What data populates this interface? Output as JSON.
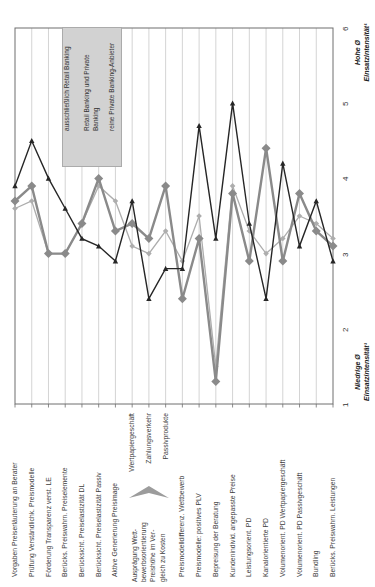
{
  "chart_data": {
    "type": "line",
    "orientation": "rotated 90deg CCW (all text reads bottom-to-top; categories left-to-right; values bottom-to-top)",
    "value_axis": {
      "min": 1,
      "max": 6,
      "ticks": [
        "1",
        "2",
        "3",
        "4",
        "5",
        "6"
      ],
      "high_label": "Hohe Ø\nEinsatzintensität¹",
      "low_label": "Niedrige Ø\nEinsatzintensität¹"
    },
    "categories": [
      "Vorgaben Preiserläuterung an Berater",
      "Prüfung Verständlichk. Preismodelle",
      "Förderung Transparenz verst. LE",
      "Berücks. Preiswahrn. Preiselemente",
      "Berücksicht. Preiselastizität DL",
      "Berücksicht. Preiselastizität Passiv",
      "Aktive Generierung Preisimage",
      "Wertpapiergeschäft",
      "Zahlungsverkehr",
      "Passivprodukte",
      "Preismodelldifferenz. Wettbewerb",
      "Preismodelle: positives PLV",
      "Bepreisung der Beratung",
      "Kundenindivid. angepasste Preise",
      "Leistungsorient. PD",
      "Kanalorientierte PD",
      "Volumenorient. PD Wertpapiergeschäft",
      "Volumenorient. PD Passivgeschäft",
      "Bundling",
      "Berücks. Preiswahrn. Leistungen"
    ],
    "series": [
      {
        "name": "ausschließlich Retail Banking",
        "legend_lines": [
          "ausschließlich Retail Banking"
        ],
        "color": "#adadad",
        "marker": "diamond-small",
        "values": [
          3.6,
          3.7,
          3.0,
          3.0,
          3.4,
          3.9,
          3.7,
          3.1,
          3.0,
          3.3,
          2.9,
          3.5,
          1.5,
          3.9,
          3.3,
          3.0,
          3.2,
          3.5,
          3.4,
          3.2
        ]
      },
      {
        "name": "Retail Banking und Private Banking",
        "legend_lines": [
          "Retail Banking und Private",
          "Banking"
        ],
        "color": "#8a8a8a",
        "marker": "diamond-large",
        "values": [
          3.7,
          3.9,
          3.0,
          3.0,
          3.4,
          4.0,
          3.3,
          3.4,
          3.2,
          3.9,
          2.4,
          3.2,
          1.3,
          3.8,
          2.9,
          4.4,
          2.9,
          3.8,
          3.3,
          3.1
        ]
      },
      {
        "name": "reine Private Banking-Anbieter",
        "legend_lines": [
          "reine Private Banking-Anbieter"
        ],
        "color": "#262626",
        "marker": "triangle",
        "values": [
          3.9,
          4.5,
          4.0,
          3.6,
          3.2,
          3.1,
          2.9,
          3.7,
          2.4,
          2.8,
          2.8,
          4.7,
          3.2,
          5.0,
          3.4,
          2.4,
          4.2,
          3.1,
          3.7,
          2.9
        ]
      }
    ],
    "annotation": {
      "lines": [
        "Ausprägung Wett-",
        "bewerbsorientierung",
        "Preishöhe im Ver-",
        "gleich zu Kosten"
      ],
      "target_indices": [
        7,
        8,
        9
      ]
    },
    "legend_position": "inside-plot upper area",
    "grid": "category gridlines on"
  },
  "colors": {
    "background": "#ffffff",
    "plot_border": "#6e6e6e",
    "gridline": "#d4d4d4",
    "legend_bg": "#d2d2d2",
    "legend_border": "#ababab",
    "text": "#3c3c3c",
    "annotation_arrow": "#9c9c9c"
  }
}
